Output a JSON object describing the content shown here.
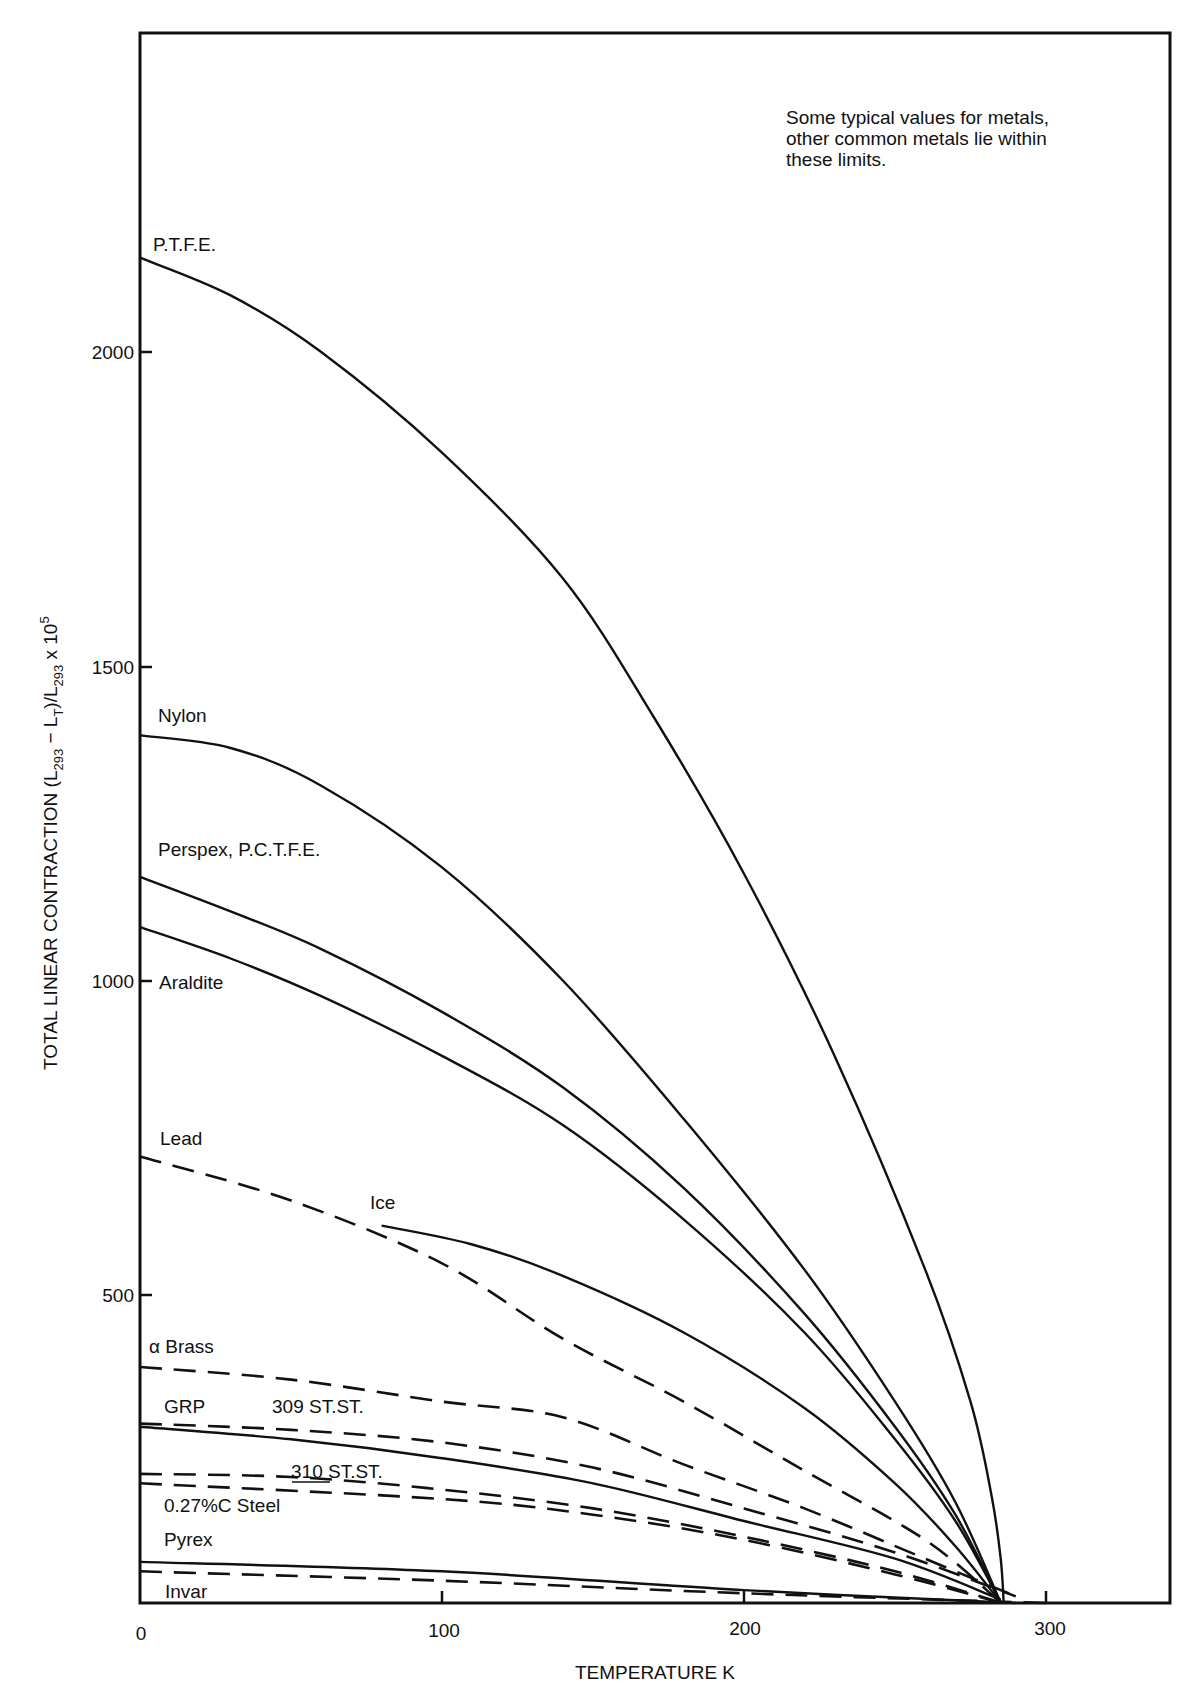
{
  "chart_data": {
    "type": "line",
    "title": "",
    "xlabel": "TEMPERATURE K",
    "ylabel": "TOTAL LINEAR CONTRACTION (L293 − LT)/L293 x 10^5",
    "xlim": [
      0,
      340
    ],
    "ylim": [
      0,
      2500
    ],
    "x_ticks": [
      0,
      100,
      200,
      300
    ],
    "y_ticks": [
      500,
      1000,
      1500,
      2000
    ],
    "grid": false,
    "legend": "inline labels",
    "annotation": "Some typical values for metals, other common metals lie within these limits.",
    "series": [
      {
        "name": "P.T.F.E.",
        "style": "solid",
        "points": [
          [
            0,
            2150
          ],
          [
            30,
            2090
          ],
          [
            60,
            2000
          ],
          [
            100,
            1840
          ],
          [
            140,
            1640
          ],
          [
            170,
            1420
          ],
          [
            200,
            1170
          ],
          [
            230,
            880
          ],
          [
            260,
            540
          ],
          [
            275,
            330
          ],
          [
            282,
            180
          ],
          [
            285,
            80
          ],
          [
            286,
            0
          ]
        ]
      },
      {
        "name": "Nylon",
        "style": "solid",
        "points": [
          [
            0,
            1390
          ],
          [
            30,
            1370
          ],
          [
            60,
            1310
          ],
          [
            100,
            1180
          ],
          [
            140,
            1000
          ],
          [
            180,
            780
          ],
          [
            220,
            540
          ],
          [
            250,
            330
          ],
          [
            270,
            170
          ],
          [
            285,
            10
          ]
        ]
      },
      {
        "name": "Perspex, P.C.T.F.E.",
        "style": "solid",
        "points": [
          [
            0,
            1165
          ],
          [
            30,
            1110
          ],
          [
            60,
            1050
          ],
          [
            100,
            950
          ],
          [
            140,
            830
          ],
          [
            180,
            670
          ],
          [
            220,
            470
          ],
          [
            250,
            290
          ],
          [
            270,
            150
          ],
          [
            285,
            10
          ]
        ]
      },
      {
        "name": "Araldite",
        "style": "solid",
        "points": [
          [
            0,
            1085
          ],
          [
            30,
            1035
          ],
          [
            60,
            975
          ],
          [
            100,
            880
          ],
          [
            140,
            770
          ],
          [
            180,
            620
          ],
          [
            220,
            440
          ],
          [
            250,
            270
          ],
          [
            270,
            140
          ],
          [
            285,
            10
          ]
        ]
      },
      {
        "name": "Lead",
        "style": "dashed",
        "points": [
          [
            0,
            720
          ],
          [
            50,
            650
          ],
          [
            100,
            550
          ],
          [
            140,
            430
          ],
          [
            180,
            330
          ],
          [
            220,
            220
          ],
          [
            260,
            110
          ],
          [
            285,
            10
          ]
        ]
      },
      {
        "name": "Ice",
        "style": "solid",
        "points": [
          [
            80,
            610
          ],
          [
            110,
            580
          ],
          [
            140,
            530
          ],
          [
            180,
            440
          ],
          [
            220,
            320
          ],
          [
            250,
            200
          ],
          [
            270,
            100
          ],
          [
            285,
            10
          ]
        ]
      },
      {
        "name": "α Brass",
        "style": "dashed",
        "points": [
          [
            0,
            385
          ],
          [
            50,
            365
          ],
          [
            100,
            330
          ],
          [
            140,
            305
          ],
          [
            180,
            230
          ],
          [
            220,
            160
          ],
          [
            260,
            80
          ],
          [
            290,
            20
          ]
        ]
      },
      {
        "name": "309 ST.ST.",
        "style": "dashed",
        "points": [
          [
            0,
            295
          ],
          [
            50,
            285
          ],
          [
            100,
            265
          ],
          [
            150,
            225
          ],
          [
            200,
            160
          ],
          [
            250,
            90
          ],
          [
            290,
            20
          ]
        ]
      },
      {
        "name": "GRP",
        "style": "solid",
        "points": [
          [
            0,
            290
          ],
          [
            50,
            270
          ],
          [
            100,
            240
          ],
          [
            150,
            200
          ],
          [
            200,
            140
          ],
          [
            250,
            80
          ],
          [
            285,
            15
          ]
        ]
      },
      {
        "name": "310 ST.ST.",
        "style": "dashed",
        "points": [
          [
            0,
            215
          ],
          [
            50,
            210
          ],
          [
            100,
            190
          ],
          [
            150,
            160
          ],
          [
            200,
            115
          ],
          [
            250,
            60
          ],
          [
            285,
            10
          ]
        ]
      },
      {
        "name": "0.27%C Steel",
        "style": "dashed",
        "points": [
          [
            0,
            200
          ],
          [
            100,
            175
          ],
          [
            150,
            150
          ],
          [
            200,
            110
          ],
          [
            250,
            55
          ],
          [
            285,
            10
          ]
        ]
      },
      {
        "name": "Pyrex",
        "style": "solid",
        "points": [
          [
            0,
            75
          ],
          [
            100,
            60
          ],
          [
            200,
            30
          ],
          [
            290,
            5
          ]
        ]
      },
      {
        "name": "Invar",
        "style": "dashed",
        "points": [
          [
            0,
            60
          ],
          [
            100,
            45
          ],
          [
            200,
            25
          ],
          [
            300,
            0
          ]
        ]
      }
    ]
  },
  "labels": {
    "ptfe": "P.T.F.E.",
    "nylon": "Nylon",
    "perspex": "Perspex, P.C.T.F.E.",
    "araldite": "Araldite",
    "lead": "Lead",
    "ice": "Ice",
    "brass": "α Brass",
    "grp": "GRP",
    "ss309": "309 ST.ST.",
    "ss310": "310 ST.ST.",
    "steel": "0.27%C Steel",
    "pyrex": "Pyrex",
    "invar": "Invar"
  },
  "axes": {
    "x_title": "TEMPERATURE K",
    "x_ticks": [
      "0",
      "100",
      "200",
      "300"
    ],
    "y_ticks": [
      "2000",
      "1500",
      "1000",
      "500"
    ],
    "y_title_main": "TOTAL LINEAR CONTRACTION (L",
    "y_title_sub1": "293",
    "y_title_mid": " − L",
    "y_title_sub2": "T",
    "y_title_mid2": ")/L",
    "y_title_sub3": "293",
    "y_title_end": " x 10",
    "y_title_sup": "5"
  },
  "note": {
    "line1": "Some typical values for metals,",
    "line2": "other common metals lie within",
    "line3": "these limits."
  }
}
